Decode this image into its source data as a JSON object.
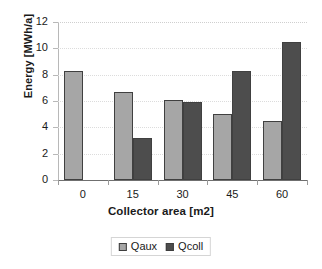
{
  "chart_data": {
    "type": "bar",
    "title": "",
    "subtitle": "",
    "xlabel": "Collector area [m2]",
    "ylabel": "Energy [MWh/a]",
    "categories": [
      "0",
      "15",
      "30",
      "45",
      "60"
    ],
    "series": [
      {
        "name": "Qaux",
        "color": "#a6a6a6",
        "values": [
          8.3,
          6.7,
          6.1,
          5.05,
          4.45
        ]
      },
      {
        "name": "Qcoll",
        "color": "#4d4d4d",
        "values": [
          0,
          3.2,
          5.95,
          8.3,
          10.45
        ]
      }
    ],
    "ylim": [
      0,
      12
    ],
    "ytick_labels": [
      "0",
      "2",
      "4",
      "6",
      "8",
      "10",
      "12"
    ],
    "ytick_values": [
      0,
      2,
      4,
      6,
      8,
      10,
      12
    ],
    "xtick_labels": [
      "0",
      "15",
      "30",
      "45",
      "60"
    ],
    "grid": true,
    "grid_axis": "y",
    "legend_position": "bottom-center",
    "legend_entries": [
      "Qaux",
      "Qcoll"
    ],
    "annotations": [],
    "background_color": "#ffffff",
    "bar_outline_color": "#404040"
  }
}
